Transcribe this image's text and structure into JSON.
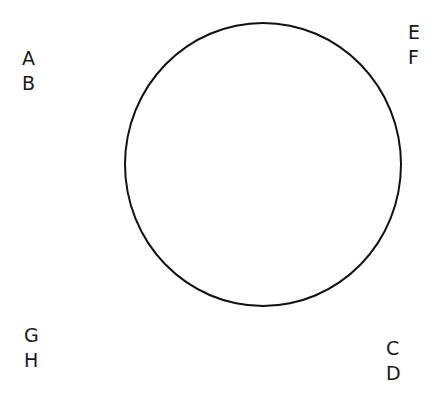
{
  "diagram": {
    "shape": "circle",
    "stroke_color": "#111111",
    "labels": {
      "top_left": [
        "A",
        "B"
      ],
      "top_right": [
        "E",
        "F"
      ],
      "bottom_left": [
        "G",
        "H"
      ],
      "bottom_right": [
        "C",
        "D"
      ]
    }
  }
}
